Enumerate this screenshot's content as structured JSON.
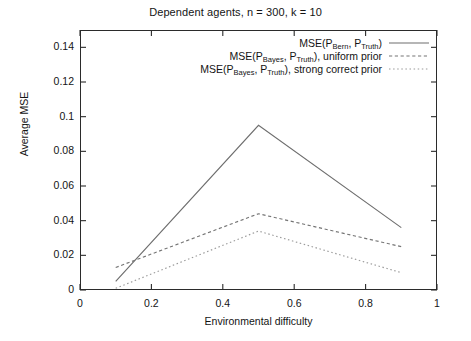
{
  "chart_data": {
    "type": "line",
    "title": "Dependent agents, n = 300, k = 10",
    "xlabel": "Environmental difficulty",
    "ylabel": "Average MSE",
    "xlim": [
      0,
      1
    ],
    "ylim": [
      0,
      0.15
    ],
    "xticks": [
      "0",
      "0.2",
      "0.4",
      "0.6",
      "0.8",
      "1"
    ],
    "xtick_values": [
      0,
      0.2,
      0.4,
      0.6,
      0.8,
      1
    ],
    "yticks": [
      "0",
      "0.02",
      "0.04",
      "0.06",
      "0.08",
      "0.1",
      "0.12",
      "0.14"
    ],
    "ytick_values": [
      0,
      0.02,
      0.04,
      0.06,
      0.08,
      0.1,
      0.12,
      0.14
    ],
    "grid": false,
    "legend_position": "top-right-inside",
    "x": [
      0.1,
      0.5,
      0.9
    ],
    "series": [
      {
        "name": "MSE(P_Bern, P_Truth)",
        "label_main": "MSE(P",
        "label_sub1": "Bern",
        "label_mid": ", P",
        "label_sub2": "Truth",
        "label_tail": ")",
        "style": "solid",
        "color": "#6e6e6e",
        "values": [
          0.005,
          0.095,
          0.036
        ]
      },
      {
        "name": "MSE(P_Bayes, P_Truth), uniform prior",
        "label_main": "MSE(P",
        "label_sub1": "Bayes",
        "label_mid": ", P",
        "label_sub2": "Truth",
        "label_tail": "), uniform prior",
        "style": "dashed",
        "color": "#757575",
        "values": [
          0.013,
          0.044,
          0.025
        ]
      },
      {
        "name": "MSE(P_Bayes, P_Truth), strong correct prior",
        "label_main": "MSE(P",
        "label_sub1": "Bayes",
        "label_mid": ", P",
        "label_sub2": "Truth",
        "label_tail": "), strong correct prior",
        "style": "dotted",
        "color": "#9a9a9a",
        "values": [
          0.001,
          0.034,
          0.01
        ]
      }
    ]
  }
}
